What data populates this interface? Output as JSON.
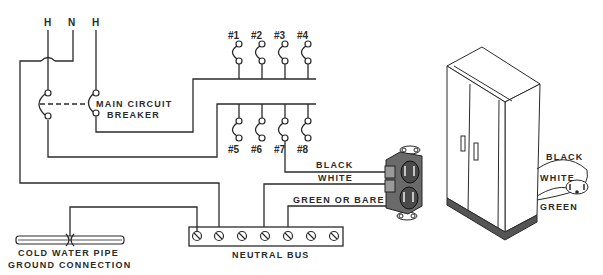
{
  "diagram": {
    "service_labels": [
      "H",
      "N",
      "H"
    ],
    "main_breaker_label": [
      "MAIN CIRCUIT",
      "BREAKER"
    ],
    "circuits_top": [
      "#1",
      "#2",
      "#3",
      "#4"
    ],
    "circuits_bottom": [
      "#5",
      "#6",
      "#7",
      "#8"
    ],
    "receptacle_wires": {
      "black": "BLACK",
      "white": "WHITE",
      "ground": "GREEN OR BARE"
    },
    "neutral_bus_label": "NEUTRAL BUS",
    "neutral_bus_screws": 7,
    "ground_label": [
      "COLD WATER PIPE",
      "GROUND CONNECTION"
    ],
    "appliance": {
      "name": "refrigerator",
      "cord_labels": [
        "BLACK",
        "WHITE",
        "GREEN"
      ]
    }
  }
}
